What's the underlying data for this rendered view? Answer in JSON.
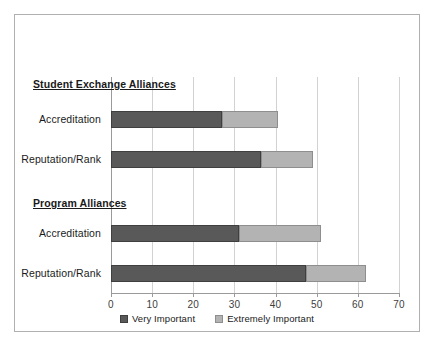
{
  "chart_data": {
    "type": "bar",
    "orientation": "horizontal",
    "stacked": true,
    "title": "",
    "xlabel": "",
    "ylabel": "",
    "xlim": [
      0,
      70
    ],
    "xticks": [
      0,
      10,
      20,
      30,
      40,
      50,
      60,
      70
    ],
    "grid": true,
    "legend_position": "bottom",
    "series": [
      {
        "name": "Very Important",
        "color": "#595959",
        "values": [
          27,
          36.5,
          31,
          47.5
        ]
      },
      {
        "name": "Extremely Important",
        "color": "#b3b3b3",
        "values": [
          13.5,
          12.5,
          20,
          14.5
        ]
      }
    ],
    "groups": [
      {
        "label": "Student Exchange Alliances",
        "categories": [
          "Accreditation",
          "Reputation/Rank"
        ],
        "very_important": [
          27,
          36.5
        ],
        "extremely_important": [
          13.5,
          12.5
        ],
        "totals": [
          40.5,
          49
        ]
      },
      {
        "label": "Program Alliances",
        "categories": [
          "Accreditation",
          "Reputation/Rank"
        ],
        "very_important": [
          31,
          47.5
        ],
        "extremely_important": [
          20,
          14.5
        ],
        "totals": [
          51,
          62
        ]
      }
    ],
    "categories": [
      "Accreditation",
      "Reputation/Rank",
      "Accreditation",
      "Reputation/Rank"
    ]
  },
  "legend": {
    "items": [
      {
        "label": "Very Important",
        "color": "#595959"
      },
      {
        "label": "Extremely Important",
        "color": "#b3b3b3"
      }
    ]
  },
  "axis": {
    "tick_labels": [
      "0",
      "10",
      "20",
      "30",
      "40",
      "50",
      "60",
      "70"
    ]
  },
  "groups": [
    {
      "header": "Student Exchange Alliances"
    },
    {
      "header": "Program Alliances"
    }
  ],
  "rows": [
    {
      "label": "Accreditation",
      "very": 27,
      "extremely": 13.5,
      "total": 40.5
    },
    {
      "label": "Reputation/Rank",
      "very": 36.5,
      "extremely": 12.5,
      "total": 49
    },
    {
      "label": "Accreditation",
      "very": 31,
      "extremely": 20,
      "total": 51
    },
    {
      "label": "Reputation/Rank",
      "very": 47.5,
      "extremely": 14.5,
      "total": 62
    }
  ],
  "colors": {
    "very_important": "#595959",
    "extremely_important": "#b3b3b3",
    "gridline": "#d2d2d2",
    "axis": "#9a9a9a",
    "frame_border": "#b0b0b0",
    "background": "#ffffff"
  }
}
